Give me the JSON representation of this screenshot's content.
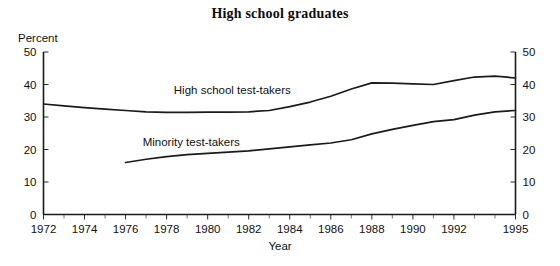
{
  "chart_data": {
    "type": "line",
    "title": "High school graduates",
    "xlabel": "Year",
    "ylabel": "Percent",
    "xlim": [
      1972,
      1995
    ],
    "ylim": [
      0,
      50
    ],
    "grid": false,
    "legend_position": "inline-annotation",
    "y_ticks": [
      0,
      10,
      20,
      30,
      40,
      50
    ],
    "y_tick_labels": [
      "0",
      "10",
      "20",
      "30",
      "40",
      "50"
    ],
    "y_axis_right_labels": [
      "0",
      "10",
      "20",
      "30",
      "40",
      "50"
    ],
    "x_ticks": [
      1972,
      1973,
      1974,
      1975,
      1976,
      1977,
      1978,
      1979,
      1980,
      1981,
      1982,
      1983,
      1984,
      1985,
      1986,
      1987,
      1988,
      1989,
      1990,
      1991,
      1992,
      1993,
      1994,
      1995
    ],
    "x_tick_labels": [
      "1972",
      "1974",
      "1976",
      "1978",
      "1980",
      "1982",
      "1984",
      "1986",
      "1988",
      "1990",
      "1992",
      "1995"
    ],
    "x_tick_label_years": [
      1972,
      1974,
      1976,
      1978,
      1980,
      1982,
      1984,
      1986,
      1988,
      1990,
      1992,
      1995
    ],
    "series": [
      {
        "name": "High school test-takers",
        "label_x": 1981.2,
        "label_y": 37.0,
        "x": [
          1972,
          1973,
          1974,
          1975,
          1976,
          1977,
          1978,
          1979,
          1980,
          1981,
          1982,
          1983,
          1984,
          1985,
          1986,
          1987,
          1988,
          1989,
          1990,
          1991,
          1992,
          1993,
          1994,
          1995
        ],
        "values": [
          34.0,
          33.4,
          32.9,
          32.4,
          32.0,
          31.6,
          31.4,
          31.4,
          31.5,
          31.5,
          31.6,
          32.0,
          33.2,
          34.6,
          36.4,
          38.6,
          40.5,
          40.4,
          40.2,
          40.0,
          41.2,
          42.3,
          42.6,
          42.0
        ]
      },
      {
        "name": "Minority test-takers",
        "label_x": 1979.2,
        "label_y": 21.0,
        "x": [
          1976,
          1977,
          1978,
          1979,
          1980,
          1981,
          1982,
          1983,
          1984,
          1985,
          1986,
          1987,
          1988,
          1989,
          1990,
          1991,
          1992,
          1993,
          1994,
          1995
        ],
        "values": [
          16.0,
          17.0,
          17.8,
          18.4,
          18.8,
          19.2,
          19.6,
          20.2,
          20.8,
          21.4,
          22.0,
          23.0,
          24.8,
          26.2,
          27.4,
          28.6,
          29.2,
          30.6,
          31.6,
          32.0
        ]
      }
    ]
  },
  "axis_color": "#1a1a1a",
  "line_color": "#1a1a1a"
}
